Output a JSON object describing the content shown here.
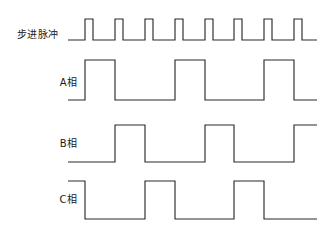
{
  "figure": {
    "title": "",
    "background_color": "#ffffff",
    "stroke_color": "#2b2b2b",
    "label_color": "#1a1a1a",
    "width": 323,
    "height": 240
  },
  "chart_data": {
    "type": "line",
    "subtype": "digital-timing-waveform",
    "title": "",
    "xlabel": "",
    "ylabel": "",
    "grid": false,
    "legend": "none",
    "x_start": 68,
    "x_end": 317,
    "series": [
      {
        "name": "step-pulse",
        "label": "步进脉冲",
        "label_x": 12,
        "label_y": 33,
        "baseline_y": 40,
        "high_y": 19,
        "initial_level": 0,
        "transitions": [
          85,
          93,
          115,
          123,
          145,
          153,
          175,
          183,
          205,
          213,
          234,
          242,
          264,
          272,
          294,
          302
        ],
        "pulse_count": 8,
        "values_desc": "low at start, 8 narrow positive pulses, low at end"
      },
      {
        "name": "phase-a",
        "label": "A相",
        "label_x": 31,
        "label_y": 81,
        "baseline_y": 100,
        "high_y": 60,
        "initial_level": 0,
        "transitions": [
          85,
          115,
          175,
          205,
          264,
          294
        ],
        "values_desc": "low, high 85-115, low, high 175-205, low, high 264-294, low"
      },
      {
        "name": "phase-b",
        "label": "B相",
        "label_x": 31,
        "label_y": 142,
        "baseline_y": 162,
        "high_y": 125,
        "initial_level": 0,
        "transitions": [
          115,
          145,
          205,
          234,
          294
        ],
        "values_desc": "low, high 115-145, low, high 205-234, low, high from 294 to end"
      },
      {
        "name": "phase-c",
        "label": "C相",
        "label_x": 31,
        "label_y": 198,
        "baseline_y": 219,
        "high_y": 181,
        "initial_level": 1,
        "transitions": [
          85,
          145,
          175,
          234,
          264
        ],
        "values_desc": "high at start to 85, low, high 145-175, low, high 234-264, low to end"
      }
    ]
  }
}
